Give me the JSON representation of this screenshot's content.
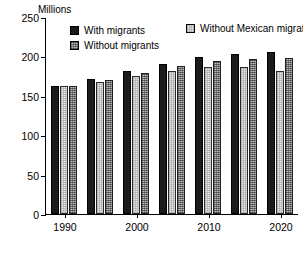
{
  "chart_data": {
    "type": "bar",
    "title": "",
    "subtitle": "",
    "xlabel": "",
    "ylabel": "Millions",
    "unit_label": "Millions",
    "ylim": [
      0,
      250
    ],
    "yticks": [
      0,
      50,
      100,
      150,
      200,
      250
    ],
    "ytick_labels": [
      "0",
      "50",
      "100",
      "150",
      "200",
      "250"
    ],
    "grid": false,
    "legend_position": "top",
    "categories": [
      "1990",
      "1995",
      "2000",
      "2005",
      "2010",
      "2015",
      "2020"
    ],
    "xtick_labels": [
      "1990",
      "2000",
      "2010",
      "2020"
    ],
    "xtick_categories": [
      "1990",
      "2000",
      "2010",
      "2020"
    ],
    "series": [
      {
        "name": "With migrants",
        "color": "#1b1b1b",
        "values": [
          163,
          171,
          181,
          191,
          199,
          203,
          205
        ]
      },
      {
        "name": "Without Mexican migration",
        "color": "#e3e3e3",
        "values": [
          163,
          170,
          179,
          188,
          194,
          197,
          198
        ]
      },
      {
        "name": "Without migrants",
        "color": "#8c8c8c",
        "values": [
          163,
          168,
          175,
          182,
          186,
          186,
          182
        ]
      }
    ]
  },
  "legend": {
    "items": [
      {
        "label": "With migrants",
        "swatch": "#1b1b1b"
      },
      {
        "label": "Without migrants",
        "swatch": "#8c8c8c"
      },
      {
        "label": "Without Mexican migration",
        "swatch": "#e3e3e3"
      }
    ]
  }
}
